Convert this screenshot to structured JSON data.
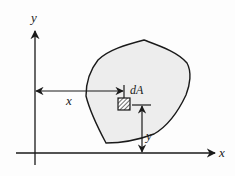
{
  "diagram": {
    "axes": {
      "x_label": "x",
      "y_label": "y"
    },
    "element_label": "dA",
    "dimension_x_label": "x",
    "dimension_y_label": "y",
    "colors": {
      "region_fill": "#ededed",
      "stroke": "#1a1a1a",
      "background": "#fdfdfd"
    }
  }
}
